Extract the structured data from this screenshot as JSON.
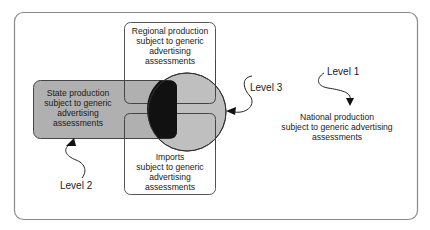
{
  "diagram": {
    "type": "nested-region-venn",
    "colors": {
      "frame_stroke": "#888888",
      "box_stroke": "#555555",
      "state_fill": "#b3b3b3",
      "circle_fill": "#bdbdbd",
      "overlap_fill": "#111111",
      "text": "#1a1a1a",
      "background": "#ffffff"
    },
    "regions": {
      "regional": {
        "line1": "Regional production",
        "line2": "subject to generic",
        "line3": "advertising",
        "line4": "assessments"
      },
      "state": {
        "line1": "State production",
        "line2": "subject to generic",
        "line3": "advertising",
        "line4": "assessments"
      },
      "imports": {
        "line1": "Imports",
        "line2": "subject to generic",
        "line3": "advertising",
        "line4": "assessments"
      },
      "national": {
        "line1": "National production",
        "line2": "subject to generic advertising",
        "line3": "assessments"
      }
    },
    "levels": {
      "level1": "Level 1",
      "level2": "Level 2",
      "level3": "Level 3"
    }
  }
}
